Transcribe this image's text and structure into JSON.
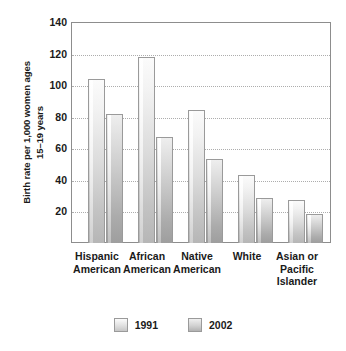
{
  "chart_data": {
    "type": "bar",
    "title": "",
    "subtitle": "",
    "xlabel": "",
    "ylabel_lines": [
      "Birth rate per 1,000 women ages",
      "15–19 years"
    ],
    "ylabel": "Birth rate per 1,000 women ages 15–19 years",
    "categories": [
      "Hispanic American",
      "African American",
      "Native American",
      "White",
      "Asian or Pacific Islander"
    ],
    "category_label_lines": [
      [
        "Hispanic",
        "American"
      ],
      [
        "African",
        "American"
      ],
      [
        "Native",
        "American"
      ],
      [
        "White"
      ],
      [
        "Asian or",
        "Pacific",
        "Islander"
      ]
    ],
    "series": [
      {
        "name": "1991",
        "values": [
          104,
          118,
          84,
          43,
          27
        ]
      },
      {
        "name": "2002",
        "values": [
          82,
          67,
          53,
          28.5,
          18.5
        ]
      }
    ],
    "ylim": [
      0,
      140
    ],
    "yticks": [
      0,
      20,
      40,
      60,
      80,
      100,
      120,
      140
    ],
    "ytick_labels": [
      "",
      "20",
      "40",
      "60",
      "80",
      "100",
      "120",
      "140"
    ],
    "grid": true,
    "grid_style": "dotted-horizontal",
    "legend_position": "bottom-center",
    "colors": {
      "series_1991": "#dcdcdc",
      "series_2002": "#c0c0c0",
      "bar_border": "#9a9a9a",
      "gridline": "#adadad",
      "axis": "#8d8d8d",
      "text": "#1a1a1a",
      "background": "#ffffff"
    }
  },
  "legend": {
    "items": [
      {
        "label": "1991"
      },
      {
        "label": "2002"
      }
    ]
  }
}
